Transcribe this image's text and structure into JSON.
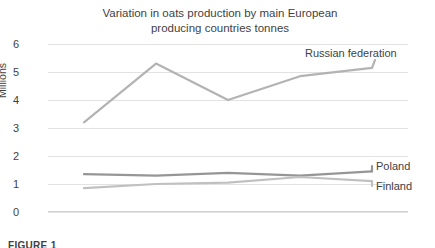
{
  "chart_data": {
    "type": "line",
    "title": "Variation in oats production by main European\nproducing countries tonnes",
    "xlabel": "",
    "ylabel": "Millions",
    "categories": [
      "2010",
      "2011",
      "2012",
      "2013",
      "2014"
    ],
    "ylim": [
      0,
      6
    ],
    "yticks": [
      "0",
      "1",
      "2",
      "3",
      "4",
      "5",
      "6"
    ],
    "grid": true,
    "legend_position": "direct-labels-right",
    "series": [
      {
        "name": "Russian federation",
        "color": "#b3b3b3",
        "values": [
          3.2,
          5.3,
          4.0,
          4.85,
          5.15
        ]
      },
      {
        "name": "Poland",
        "color": "#969696",
        "values": [
          1.35,
          1.3,
          1.4,
          1.3,
          1.45
        ]
      },
      {
        "name": "Finland",
        "color": "#c0c0c0",
        "values": [
          0.85,
          1.0,
          1.05,
          1.25,
          1.1
        ]
      }
    ]
  },
  "caption": {
    "text": "FIGURE 1"
  },
  "colors": {
    "gridline": "#e2e2e2",
    "axis": "#d2d2d2",
    "text": "#3f3f3f",
    "background": "#ffffff"
  }
}
